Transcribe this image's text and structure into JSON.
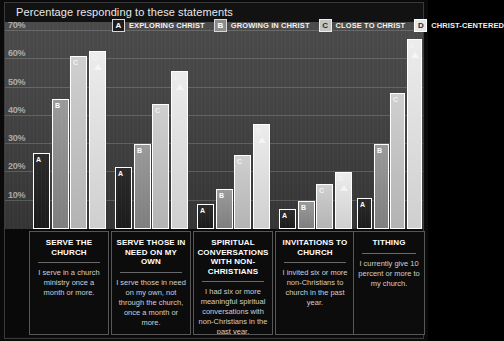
{
  "header": {
    "title": "Percentage responding to these statements"
  },
  "legend": {
    "items": [
      {
        "key": "A",
        "label": "EXPLORING CHRIST"
      },
      {
        "key": "B",
        "label": "GROWING IN CHRIST"
      },
      {
        "key": "C",
        "label": "CLOSE TO CHRIST"
      },
      {
        "key": "D",
        "label": "CHRIST-CENTERED"
      }
    ]
  },
  "axis": {
    "ticks": [
      "70%",
      "60%",
      "50%",
      "40%",
      "30%",
      "20%",
      "10%"
    ]
  },
  "captions": [
    {
      "heading": "SERVE THE CHURCH",
      "body": "I serve in a church ministry once a month or more."
    },
    {
      "heading": "SERVE THOSE IN NEED ON MY OWN",
      "body": "I serve those in need on my own, not through the church, once a month or more."
    },
    {
      "heading": "SPIRITUAL CONVERSATIONS WITH NON-CHRISTIANS",
      "body": "I had six or more meaningful spiritual conversations with non-Christians in the past year."
    },
    {
      "heading": "INVITATIONS TO CHURCH",
      "body": "I invited six or more non-Christians to church in the past year."
    },
    {
      "heading": "TITHING",
      "body": "I currently give 10 percent or more to my church."
    }
  ],
  "chart_data": {
    "type": "bar",
    "title": "Percentage responding to these statements",
    "xlabel": "",
    "ylabel": "",
    "ylim": [
      0,
      70
    ],
    "yticks": [
      10,
      20,
      30,
      40,
      50,
      60,
      70
    ],
    "grid": true,
    "legend_position": "top",
    "categories": [
      "SERVE THE CHURCH",
      "SERVE THOSE IN NEED ON MY OWN",
      "SPIRITUAL CONVERSATIONS WITH NON-CHRISTIANS",
      "INVITATIONS TO CHURCH",
      "TITHING"
    ],
    "series": [
      {
        "name": "EXPLORING CHRIST",
        "key": "A",
        "values": [
          27,
          22,
          9,
          7,
          11
        ]
      },
      {
        "name": "GROWING IN CHRIST",
        "key": "B",
        "values": [
          46,
          30,
          14,
          10,
          30
        ]
      },
      {
        "name": "CLOSE TO CHRIST",
        "key": "C",
        "values": [
          61,
          44,
          26,
          16,
          48
        ]
      },
      {
        "name": "CHRIST-CENTERED",
        "key": "D",
        "values": [
          63,
          56,
          37,
          20,
          67
        ]
      }
    ]
  }
}
